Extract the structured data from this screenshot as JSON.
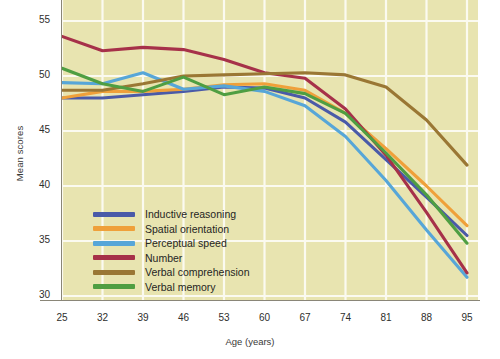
{
  "axes": {
    "ylabel": "Mean scores",
    "xlabel": "Age (years)",
    "yticks": [
      "55",
      "50",
      "45",
      "40",
      "35",
      "30"
    ],
    "xticks": [
      "25",
      "32",
      "39",
      "46",
      "53",
      "60",
      "67",
      "74",
      "81",
      "88",
      "95"
    ]
  },
  "legend": {
    "items": [
      {
        "label": "Inductive reasoning",
        "color": "#4a5aa8"
      },
      {
        "label": "Spatial orientation",
        "color": "#efa03a"
      },
      {
        "label": "Perceptual speed",
        "color": "#57a6d8"
      },
      {
        "label": "Number",
        "color": "#a63149"
      },
      {
        "label": "Verbal comprehension",
        "color": "#9a7734"
      },
      {
        "label": "Verbal memory",
        "color": "#4f9e42"
      }
    ]
  },
  "style": {
    "plot_background": "#e8e4b0",
    "gridline_color": "#fbfaf0",
    "axis_color": "#8a8678"
  },
  "caption": "",
  "chart_data": {
    "type": "line",
    "title": "",
    "xlabel": "Age (years)",
    "ylabel": "Mean scores",
    "xlim": [
      25,
      95
    ],
    "ylim": [
      30,
      55
    ],
    "grid": true,
    "legend_position": "inside-lower-left",
    "x": [
      25,
      32,
      39,
      46,
      53,
      60,
      67,
      74,
      81,
      88,
      95
    ],
    "series": [
      {
        "name": "Inductive reasoning",
        "color": "#4a5aa8",
        "values": [
          48.0,
          48.0,
          48.3,
          48.6,
          49.0,
          48.9,
          48.0,
          45.8,
          42.4,
          39.0,
          35.5
        ]
      },
      {
        "name": "Spatial orientation",
        "color": "#efa03a",
        "values": [
          48.0,
          48.6,
          48.6,
          48.8,
          49.2,
          49.3,
          48.7,
          46.6,
          43.4,
          40.0,
          36.4
        ]
      },
      {
        "name": "Perceptual speed",
        "color": "#57a6d8",
        "values": [
          49.4,
          49.3,
          50.3,
          48.8,
          49.1,
          48.6,
          47.3,
          44.5,
          40.5,
          36.0,
          31.7
        ]
      },
      {
        "name": "Number",
        "color": "#a63149",
        "values": [
          53.6,
          52.3,
          52.6,
          52.4,
          51.5,
          50.3,
          49.8,
          47.0,
          42.8,
          37.6,
          32.1
        ]
      },
      {
        "name": "Verbal comprehension",
        "color": "#9a7734",
        "values": [
          48.7,
          48.7,
          49.3,
          50.0,
          50.1,
          50.2,
          50.3,
          50.1,
          49.0,
          46.0,
          41.9
        ]
      },
      {
        "name": "Verbal memory",
        "color": "#4f9e42",
        "values": [
          50.7,
          49.3,
          48.6,
          49.9,
          48.3,
          49.0,
          48.4,
          46.6,
          43.0,
          39.2,
          34.8
        ]
      }
    ]
  }
}
